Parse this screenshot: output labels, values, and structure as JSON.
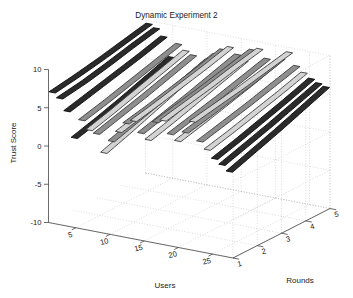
{
  "figure": {
    "title": "Dynamic Experiment 2",
    "background": "#ffffff",
    "grid_color": "#b9b9b9",
    "axis_color": "#3a3a3a"
  },
  "chart_data": {
    "type": "line",
    "title": "Dynamic Experiment 2",
    "xlabel": "Users",
    "ylabel": "Rounds",
    "zlabel": "Trust Score",
    "projection": "3d",
    "grid": true,
    "legend": null,
    "x": "Users",
    "xlim": [
      1,
      28
    ],
    "xticks": [
      5,
      10,
      15,
      20,
      25
    ],
    "xticklabels": [
      "5",
      "10",
      "15",
      "20",
      "25"
    ],
    "ylim": [
      1,
      5
    ],
    "yticks": [
      1,
      2,
      3,
      4,
      5
    ],
    "yticklabels": [
      "1",
      "2",
      "3",
      "4",
      "5"
    ],
    "zlim": [
      -10,
      10
    ],
    "zticks": [
      -10,
      -5,
      0,
      5,
      10
    ],
    "zticklabels": [
      "-10",
      "-5",
      "0",
      "5",
      "10"
    ],
    "series_label": "Trust Score per user across rounds",
    "series_count": 25,
    "colors": [
      "#000000",
      "#6b6b6b",
      "#9a9a9a"
    ],
    "series": [
      {
        "name": "User 1",
        "round_values": [
          7.1,
          7.6,
          8.2,
          8.9,
          9.6
        ]
      },
      {
        "name": "User 2",
        "round_values": [
          6.5,
          7.0,
          7.7,
          8.5,
          9.2
        ]
      },
      {
        "name": "User 3",
        "round_values": [
          5.0,
          5.8,
          6.6,
          7.4,
          8.3
        ]
      },
      {
        "name": "User 4",
        "round_values": [
          1.7,
          2.6,
          3.6,
          4.7,
          5.8
        ]
      },
      {
        "name": "User 5",
        "round_values": [
          4.2,
          5.0,
          5.9,
          6.8,
          7.7
        ]
      },
      {
        "name": "User 6",
        "round_values": [
          3.1,
          4.0,
          5.0,
          6.0,
          7.0
        ]
      },
      {
        "name": "User 7",
        "round_values": [
          2.8,
          3.7,
          4.6,
          5.6,
          6.6
        ]
      },
      {
        "name": "User 8",
        "round_values": [
          0.5,
          1.6,
          2.8,
          4.0,
          5.2
        ]
      },
      {
        "name": "User 9",
        "round_values": [
          2.2,
          3.2,
          4.2,
          5.3,
          6.4
        ]
      },
      {
        "name": "User 10",
        "round_values": [
          3.6,
          4.4,
          5.3,
          6.3,
          7.3
        ]
      },
      {
        "name": "User 11",
        "round_values": [
          4.9,
          5.6,
          6.4,
          7.2,
          8.1
        ]
      },
      {
        "name": "User 12",
        "round_values": [
          5.4,
          6.1,
          6.9,
          7.7,
          8.6
        ]
      },
      {
        "name": "User 13",
        "round_values": [
          4.0,
          4.9,
          5.8,
          6.8,
          7.8
        ]
      },
      {
        "name": "User 14",
        "round_values": [
          3.3,
          4.2,
          5.2,
          6.2,
          7.2
        ]
      },
      {
        "name": "User 15",
        "round_values": [
          5.8,
          6.5,
          7.2,
          8.0,
          8.8
        ]
      },
      {
        "name": "User 16",
        "round_values": [
          6.2,
          6.9,
          7.6,
          8.4,
          9.1
        ]
      },
      {
        "name": "User 17",
        "round_values": [
          4.6,
          5.4,
          6.2,
          7.1,
          8.0
        ]
      },
      {
        "name": "User 18",
        "round_values": [
          3.9,
          4.7,
          5.6,
          6.5,
          7.5
        ]
      },
      {
        "name": "User 19",
        "round_values": [
          5.2,
          5.9,
          6.7,
          7.5,
          8.4
        ]
      },
      {
        "name": "User 20",
        "round_values": [
          6.8,
          7.4,
          8.0,
          8.7,
          9.4
        ]
      },
      {
        "name": "User 21",
        "round_values": [
          4.4,
          5.2,
          6.0,
          6.9,
          7.8
        ]
      },
      {
        "name": "User 22",
        "round_values": [
          3.5,
          4.3,
          5.2,
          6.1,
          7.1
        ]
      },
      {
        "name": "User 23",
        "round_values": [
          2.5,
          3.4,
          4.4,
          5.4,
          6.5
        ]
      },
      {
        "name": "User 24",
        "round_values": [
          1.9,
          2.9,
          3.9,
          5.0,
          6.1
        ]
      },
      {
        "name": "User 25",
        "round_values": [
          1.2,
          2.3,
          3.4,
          4.6,
          5.8
        ]
      }
    ]
  }
}
